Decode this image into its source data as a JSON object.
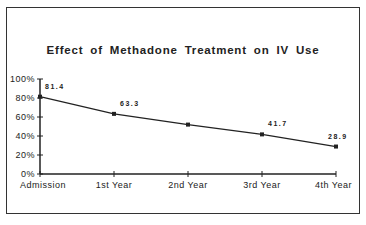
{
  "chart_data": {
    "type": "line",
    "title": "Effect of Methadone Treatment on IV Use",
    "xlabel": "",
    "ylabel": "",
    "categories": [
      "Admission",
      "1st Year",
      "2nd Year",
      "3rd Year",
      "4th Year"
    ],
    "series": [
      {
        "name": "IV Use",
        "values": [
          81.4,
          63.3,
          52,
          41.7,
          28.9
        ]
      }
    ],
    "data_labels": [
      "81.4",
      "63.3",
      "",
      "41.7",
      "28.9"
    ],
    "yticks": [
      "0%",
      "20%",
      "40%",
      "60%",
      "80%",
      "100%"
    ],
    "ylim": [
      0,
      100
    ],
    "grid": false,
    "legend": "none"
  }
}
